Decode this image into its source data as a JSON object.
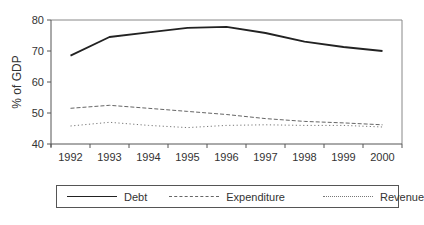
{
  "chart_data": {
    "type": "line",
    "title": "",
    "xlabel": "",
    "ylabel": "% of GDP",
    "ylim": [
      40,
      80
    ],
    "yticks": [
      40,
      50,
      60,
      70,
      80
    ],
    "grid": false,
    "legend_position": "bottom",
    "x": [
      "1992",
      "1993",
      "1994",
      "1995",
      "1996",
      "1997",
      "1998",
      "1999",
      "2000"
    ],
    "series": [
      {
        "name": "Debt",
        "style": "solid",
        "color": "#222222",
        "values": [
          68.5,
          74.5,
          76.0,
          77.5,
          77.8,
          75.8,
          73.0,
          71.3,
          70.0
        ]
      },
      {
        "name": "Expenditure",
        "style": "dashed",
        "color": "#666666",
        "values": [
          51.5,
          52.5,
          51.5,
          50.5,
          49.5,
          48.2,
          47.3,
          46.8,
          46.2
        ]
      },
      {
        "name": "Revenue",
        "style": "dotted",
        "color": "#777777",
        "values": [
          45.8,
          47.0,
          46.0,
          45.3,
          46.0,
          46.2,
          46.0,
          46.0,
          45.5
        ]
      }
    ]
  },
  "legend": {
    "items": [
      {
        "label": "Debt"
      },
      {
        "label": "Expenditure"
      },
      {
        "label": "Revenue"
      }
    ]
  }
}
